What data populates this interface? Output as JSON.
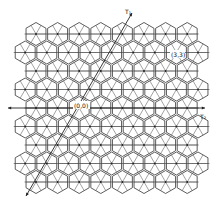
{
  "figure": {
    "colors": {
      "line": "#333333",
      "background": "#ffffff"
    },
    "lattice": {
      "rows": 9,
      "row_y": [
        34,
        52.5,
        71,
        89.5,
        108,
        126.5,
        145,
        163.5,
        182
      ],
      "hex_spacing_x": 21.6,
      "row_start_x": [
        36,
        25.2
      ],
      "hexes_per_row": [
        8,
        9
      ],
      "hex_radius": 11.5
    },
    "labels": {
      "origin": "(0,0)",
      "point": "(3,3)",
      "vector_1": "T₁",
      "vector_2": "T₂"
    },
    "axes": {
      "horizontal": {
        "x1": 8,
        "y1": 108,
        "x2": 205,
        "y2": 108
      },
      "diagonal": {
        "x1": 26,
        "y1": 196,
        "x2": 132,
        "y2": 13
      }
    }
  }
}
